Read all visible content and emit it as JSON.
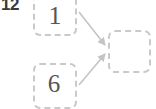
{
  "worksheet": {
    "problem_number": "12",
    "cells": [
      {
        "name": "addend-1",
        "value": "1",
        "editable": true
      },
      {
        "name": "addend-2",
        "value": "6",
        "editable": true
      },
      {
        "name": "result",
        "value": "",
        "editable": true
      }
    ],
    "arrows": [
      {
        "name": "arrow-addend-1-to-result",
        "from": "addend-1",
        "to": "result"
      },
      {
        "name": "arrow-addend-2-to-result",
        "from": "addend-2",
        "to": "result"
      }
    ],
    "colors": {
      "cell_border": "#c9c9c9",
      "arrow": "#c4c4c4",
      "digit_text": "#555555",
      "label_text": "#3a3a3a",
      "background": "#ffffff"
    }
  }
}
